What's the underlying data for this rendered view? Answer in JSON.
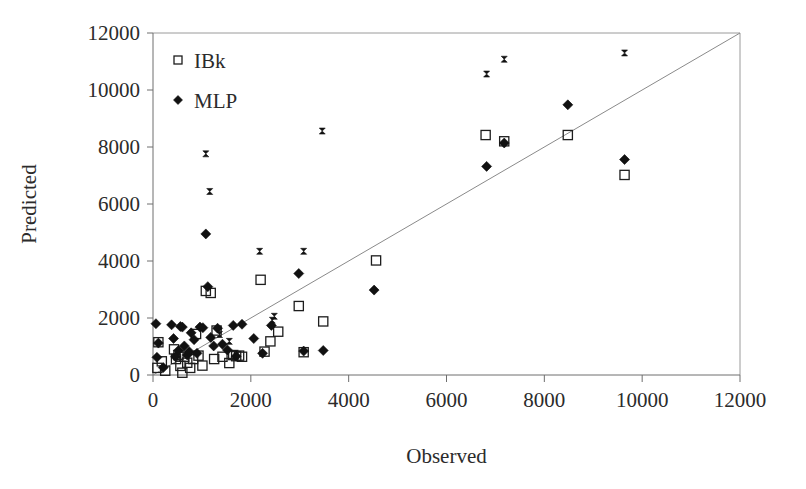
{
  "figure": {
    "background_color": "#ffffff",
    "axis_color": "#6e6e6e",
    "marker_color": "#111111",
    "reference_line_color": "#8a8a8a"
  },
  "chart_data": {
    "type": "scatter",
    "title": "",
    "xlabel": "Observed",
    "ylabel": "Predicted",
    "xlim": [
      0,
      12000
    ],
    "ylim": [
      0,
      12000
    ],
    "xticks": [
      0,
      2000,
      4000,
      6000,
      8000,
      10000,
      12000
    ],
    "yticks": [
      0,
      2000,
      4000,
      6000,
      8000,
      10000,
      12000
    ],
    "xtick_labels": [
      "0",
      "2000",
      "4000",
      "6000",
      "8000",
      "10000",
      "12000"
    ],
    "ytick_labels": [
      "0",
      "2000",
      "4000",
      "6000",
      "8000",
      "10000",
      "12000"
    ],
    "grid": false,
    "legend_position": "top-left",
    "reference_line": {
      "label": "y = x",
      "from": [
        0,
        0
      ],
      "to": [
        12000,
        12000
      ]
    },
    "legend": [
      {
        "name": "IBk",
        "marker": "open-square"
      },
      {
        "name": "MLP",
        "marker": "filled-diamond"
      }
    ],
    "series": [
      {
        "name": "IBk",
        "marker": "open-square",
        "points": [
          [
            90,
            250
          ],
          [
            110,
            1150
          ],
          [
            180,
            480
          ],
          [
            250,
            150
          ],
          [
            430,
            900
          ],
          [
            470,
            560
          ],
          [
            520,
            700
          ],
          [
            560,
            320
          ],
          [
            600,
            80
          ],
          [
            640,
            640
          ],
          [
            700,
            430
          ],
          [
            760,
            250
          ],
          [
            820,
            560
          ],
          [
            880,
            1440
          ],
          [
            930,
            680
          ],
          [
            1010,
            330
          ],
          [
            1080,
            2950
          ],
          [
            1180,
            2880
          ],
          [
            1250,
            560
          ],
          [
            1300,
            1560
          ],
          [
            1420,
            640
          ],
          [
            1560,
            420
          ],
          [
            1640,
            700
          ],
          [
            1700,
            660
          ],
          [
            1760,
            680
          ],
          [
            1820,
            640
          ],
          [
            2200,
            3340
          ],
          [
            2280,
            820
          ],
          [
            2400,
            1180
          ],
          [
            2560,
            1520
          ],
          [
            2980,
            2420
          ],
          [
            3080,
            800
          ],
          [
            3480,
            1880
          ],
          [
            4560,
            4020
          ],
          [
            6800,
            8420
          ],
          [
            7180,
            8200
          ],
          [
            8480,
            8420
          ],
          [
            9640,
            7020
          ]
        ]
      },
      {
        "name": "MLP",
        "marker": "filled-diamond",
        "points": [
          [
            60,
            1800
          ],
          [
            80,
            620
          ],
          [
            110,
            1120
          ],
          [
            210,
            260
          ],
          [
            380,
            1760
          ],
          [
            420,
            1280
          ],
          [
            460,
            640
          ],
          [
            520,
            860
          ],
          [
            560,
            1700
          ],
          [
            600,
            1680
          ],
          [
            640,
            1020
          ],
          [
            700,
            700
          ],
          [
            740,
            820
          ],
          [
            780,
            1480
          ],
          [
            840,
            1240
          ],
          [
            900,
            760
          ],
          [
            960,
            1680
          ],
          [
            1020,
            1660
          ],
          [
            1080,
            4950
          ],
          [
            1120,
            3100
          ],
          [
            1180,
            1320
          ],
          [
            1240,
            1020
          ],
          [
            1320,
            1640
          ],
          [
            1420,
            1080
          ],
          [
            1520,
            880
          ],
          [
            1640,
            1740
          ],
          [
            1700,
            660
          ],
          [
            1820,
            1780
          ],
          [
            2060,
            1280
          ],
          [
            2240,
            760
          ],
          [
            2420,
            1740
          ],
          [
            2980,
            3560
          ],
          [
            3080,
            840
          ],
          [
            3480,
            860
          ],
          [
            4520,
            2980
          ],
          [
            6820,
            7320
          ],
          [
            7180,
            8140
          ],
          [
            8480,
            9480
          ],
          [
            9640,
            7560
          ]
        ]
      },
      {
        "name": "Overlapping",
        "marker": "overlap-x",
        "points": [
          [
            1080,
            7760
          ],
          [
            1160,
            6440
          ],
          [
            1360,
            1420
          ],
          [
            1560,
            1180
          ],
          [
            2180,
            4340
          ],
          [
            2440,
            1920
          ],
          [
            2480,
            2060
          ],
          [
            3080,
            4340
          ],
          [
            3460,
            8560
          ],
          [
            6820,
            10560
          ],
          [
            7180,
            11080
          ],
          [
            9640,
            11300
          ]
        ]
      }
    ]
  },
  "axis_titles": {
    "x": "Observed",
    "y": "Predicted"
  }
}
